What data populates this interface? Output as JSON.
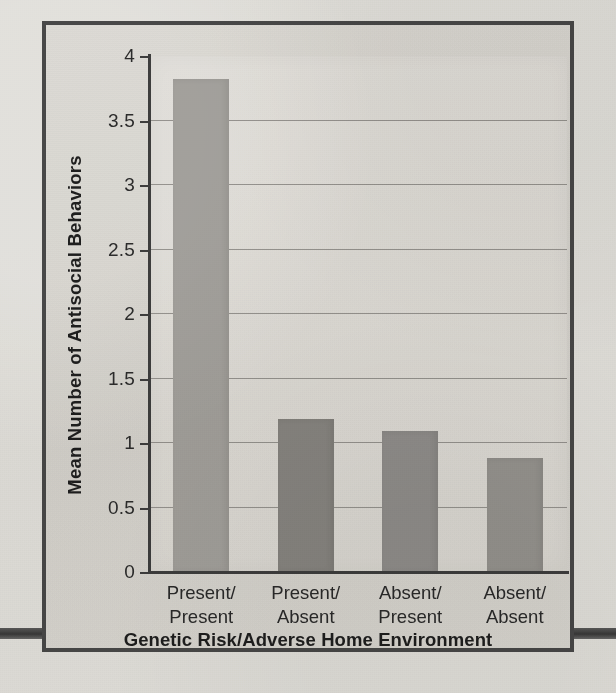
{
  "figure": {
    "frame_border_color": "#4a4a4a",
    "panel_color": "#e2e0db",
    "page_background": "#e8e7e3"
  },
  "chart_data": {
    "type": "bar",
    "title": "",
    "subtitle": "",
    "xlabel": "Genetic Risk/Adverse Home Environment",
    "ylabel": "Mean Number of Antisocial Behaviors",
    "categories": [
      "Present/\nPresent",
      "Present/\nAbsent",
      "Absent/\nPresent",
      "Absent/\nAbsent"
    ],
    "category_lines": [
      [
        "Present/",
        "Present"
      ],
      [
        "Present/",
        "Absent"
      ],
      [
        "Absent/",
        "Present"
      ],
      [
        "Absent/",
        "Absent"
      ]
    ],
    "values": [
      3.82,
      1.19,
      1.09,
      0.88
    ],
    "bar_colors": [
      "#a7a5a1",
      "#8b8985",
      "#949290",
      "#9a9894"
    ],
    "ylim": [
      0,
      4
    ],
    "ytick_values": [
      0,
      0.5,
      1,
      1.5,
      2,
      2.5,
      3,
      3.5,
      4
    ],
    "ytick_labels": [
      "0",
      "0.5",
      "1",
      "1.5",
      "2",
      "2.5",
      "3",
      "3.5",
      "4"
    ],
    "grid": "horizontal",
    "gridline_values": [
      0.5,
      1,
      1.5,
      2,
      2.5,
      3,
      3.5
    ],
    "gridline_color": "#8c8a86",
    "axis_color": "#3f3f3f",
    "legend": null,
    "legend_position": "none",
    "annotations": []
  },
  "decorations": {
    "rule_left_label": "page-rule-left",
    "rule_right_label": "page-rule-right",
    "rule_color": "#4a4a4a"
  }
}
